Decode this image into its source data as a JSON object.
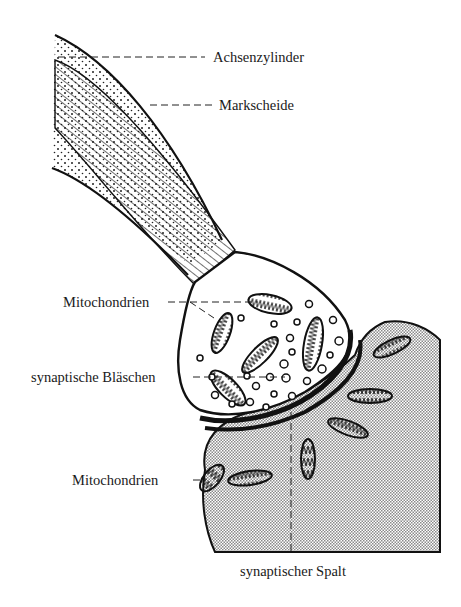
{
  "diagram": {
    "type": "anatomical-illustration",
    "colors": {
      "ink": "#111111",
      "paper": "#ffffff",
      "stipple": "#8a8a8a"
    },
    "labels": [
      {
        "id": "achsenzylinder",
        "text": "Achsenzylinder",
        "x": 213,
        "y": 52
      },
      {
        "id": "markscheide",
        "text": "Markscheide",
        "x": 219,
        "y": 100
      },
      {
        "id": "mitochondrien_pre",
        "text": "Mitochondrien",
        "x": 63,
        "y": 297
      },
      {
        "id": "synaptische_blaeschen",
        "text": "synaptische Bläschen",
        "x": 31,
        "y": 372
      },
      {
        "id": "mitochondrien_post",
        "text": "Mitochondrien",
        "x": 72,
        "y": 475
      },
      {
        "id": "synaptischer_spalt",
        "text": "synaptischer Spalt",
        "x": 240,
        "y": 566
      }
    ]
  }
}
